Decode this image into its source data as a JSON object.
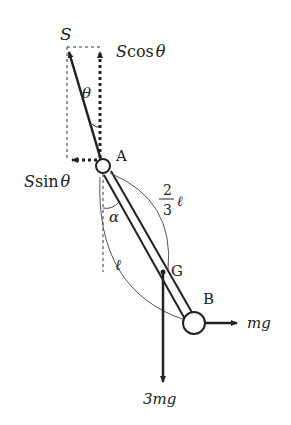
{
  "diagram": {
    "labels": {
      "S": "S",
      "Scos_S": "S",
      "Scos_fn": "cos",
      "Scos_theta": "θ",
      "Ssin_S": "S",
      "Ssin_fn": "sin",
      "Ssin_theta": "θ",
      "theta": "θ",
      "alpha": "α",
      "A": "A",
      "G": "G",
      "B": "B",
      "frac_num": "2",
      "frac_den": "3",
      "frac_l": "ℓ",
      "l": "ℓ",
      "mg": "mg",
      "three_mg": "3mg"
    },
    "colors": {
      "stroke": "#222222",
      "arc": "#555555",
      "background": "#ffffff"
    }
  }
}
